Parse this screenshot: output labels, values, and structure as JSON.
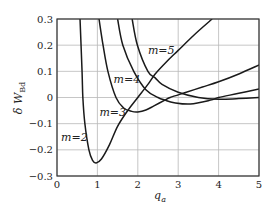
{
  "chart_data": {
    "type": "line",
    "title": "",
    "xlabel": "q_a",
    "ylabel": "δ W_Bd",
    "xlim": [
      0,
      5
    ],
    "ylim": [
      -0.3,
      0.3
    ],
    "xticks": [
      0,
      1,
      2,
      3,
      4,
      5
    ],
    "yticks": [
      -0.3,
      -0.2,
      -0.1,
      0,
      0.1,
      0.2,
      0.3
    ],
    "xtick_labels": [
      "0",
      "1",
      "2",
      "3",
      "4",
      "5"
    ],
    "ytick_labels": [
      "−0.3",
      "−0.2",
      "−0.1",
      "0",
      "0.1",
      "0.2",
      "0.3"
    ],
    "grid": true,
    "legend": "inline labels",
    "series": [
      {
        "name": "m=2",
        "x": [
          0.57,
          0.62,
          0.64,
          0.69,
          0.79,
          0.88,
          0.97,
          1.1,
          1.3,
          1.5,
          1.75,
          2.0,
          2.25,
          2.43,
          2.7,
          3.0,
          3.4,
          3.84
        ],
        "y": [
          0.3,
          0.1,
          0.0,
          -0.1,
          -0.2,
          -0.24,
          -0.25,
          -0.235,
          -0.18,
          -0.11,
          -0.05,
          0.0,
          0.05,
          0.09,
          0.135,
          0.18,
          0.24,
          0.3
        ],
        "label_pos": [
          0.1,
          -0.15
        ]
      },
      {
        "name": "m=3",
        "x": [
          1.04,
          1.14,
          1.26,
          1.46,
          1.65,
          1.85,
          2.0,
          2.2,
          2.4,
          2.67,
          2.8,
          3.2,
          3.6,
          4.0,
          4.5,
          5.0
        ],
        "y": [
          0.3,
          0.2,
          0.1,
          0.0,
          -0.04,
          -0.053,
          -0.055,
          -0.048,
          -0.032,
          -0.01,
          0.0,
          0.02,
          0.04,
          0.06,
          0.09,
          0.124
        ],
        "label_pos": [
          1.05,
          -0.055
        ]
      },
      {
        "name": "m=4",
        "x": [
          1.5,
          1.63,
          1.9,
          2.2,
          2.5,
          2.67,
          2.9,
          3.3,
          3.8,
          4.0,
          4.5,
          5.0
        ],
        "y": [
          0.3,
          0.2,
          0.1,
          0.03,
          0.0,
          -0.01,
          -0.02,
          -0.025,
          -0.01,
          0.0,
          0.016,
          0.033
        ],
        "label_pos": [
          1.4,
          0.07
        ]
      },
      {
        "name": "m=5",
        "x": [
          1.86,
          1.99,
          2.25,
          2.43,
          2.6,
          3.0,
          3.5,
          4.0,
          4.5,
          5.0
        ],
        "y": [
          0.3,
          0.2,
          0.1,
          0.075,
          0.05,
          0.02,
          0.0,
          -0.007,
          -0.004,
          0.0
        ],
        "label_pos": [
          2.25,
          0.18
        ]
      }
    ]
  }
}
